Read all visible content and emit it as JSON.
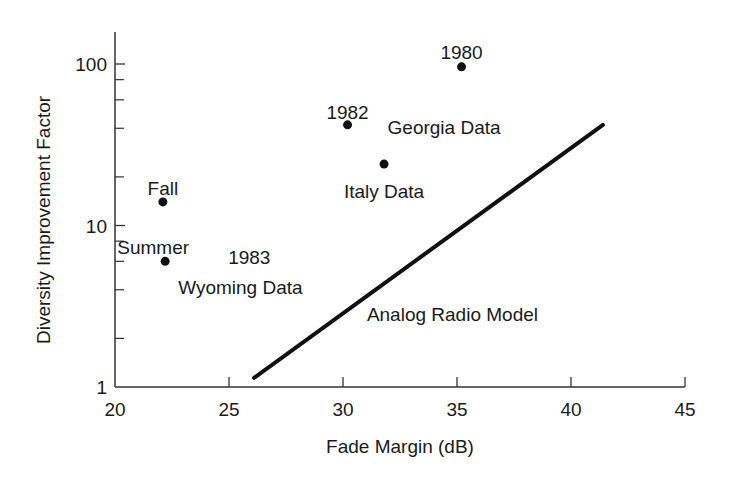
{
  "chart_data": {
    "type": "scatter",
    "title": "",
    "xlabel": "Fade Margin (dB)",
    "ylabel": "Diversity Improvement Factor",
    "xlim": [
      20,
      45
    ],
    "ylim": [
      1,
      160
    ],
    "yscale": "log",
    "grid": false,
    "legend": "none",
    "x_ticks": [
      20,
      25,
      30,
      35,
      40,
      45
    ],
    "x_tick_labels": [
      "20",
      "25",
      "30",
      "35",
      "40",
      "45"
    ],
    "y_major_ticks": [
      1,
      10,
      100
    ],
    "y_tick_labels": [
      "1",
      "10",
      "100"
    ],
    "y_minor_ticks": [
      2,
      4,
      6,
      8,
      20,
      40,
      60,
      80
    ],
    "series": [
      {
        "name": "Wyoming Data (1983)",
        "type": "scatter",
        "points": [
          {
            "x": 22.1,
            "y": 14,
            "label": "Fall"
          },
          {
            "x": 22.2,
            "y": 6,
            "label": "Summer"
          }
        ]
      },
      {
        "name": "Georgia Data",
        "type": "scatter",
        "points": [
          {
            "x": 35.2,
            "y": 96,
            "label": "1980"
          },
          {
            "x": 30.2,
            "y": 42,
            "label": "1982"
          }
        ]
      },
      {
        "name": "Italy Data",
        "type": "scatter",
        "points": [
          {
            "x": 31.8,
            "y": 24,
            "label": ""
          }
        ]
      },
      {
        "name": "Analog Radio Model",
        "type": "line",
        "points": [
          {
            "x": 26.1,
            "y": 1.14
          },
          {
            "x": 41.4,
            "y": 42
          }
        ]
      }
    ],
    "annotations": [
      {
        "text": "1980",
        "x": 35.2,
        "y": 96,
        "dx": 0,
        "dy": -14,
        "anchor": "middle"
      },
      {
        "text": "1982",
        "x": 30.2,
        "y": 42,
        "dx": 0,
        "dy": -12,
        "anchor": "middle"
      },
      {
        "text": "Georgia Data",
        "x": 30.2,
        "y": 42,
        "dx": 40,
        "dy": 3,
        "anchor": "start"
      },
      {
        "text": "Italy Data",
        "x": 31.8,
        "y": 24,
        "dx": 0,
        "dy": 28,
        "anchor": "middle"
      },
      {
        "text": "Fall",
        "x": 22.1,
        "y": 14,
        "dx": 0,
        "dy": -13,
        "anchor": "middle"
      },
      {
        "text": "Summer",
        "x": 22.2,
        "y": 6,
        "dx": -12,
        "dy": -13,
        "anchor": "middle"
      },
      {
        "text": "1983",
        "x": 22.2,
        "y": 6,
        "dx": 63,
        "dy": -3,
        "anchor": "start"
      },
      {
        "text": "Wyoming Data",
        "x": 22.2,
        "y": 6,
        "dx": 13,
        "dy": 27,
        "anchor": "start"
      },
      {
        "text": "Analog Radio Model",
        "x": 34.8,
        "y": 2.8,
        "dx": 0,
        "dy": 0,
        "anchor": "middle"
      }
    ]
  },
  "layout_px": {
    "x0": 115,
    "x1": 685,
    "y_axis_bottom": 387,
    "y_axis_top": 32,
    "px_per_decade": 161.5
  }
}
